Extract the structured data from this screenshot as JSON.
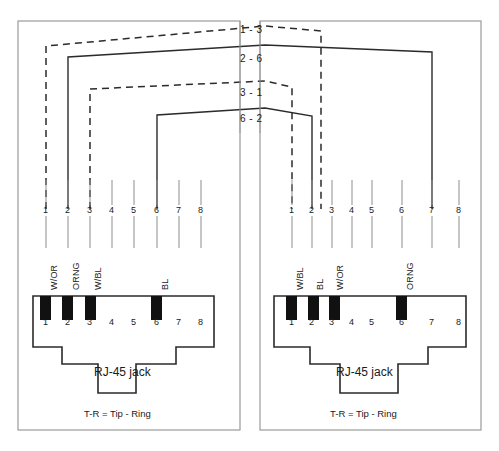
{
  "diagram": {
    "panels": [
      {
        "id": "left",
        "jack_label": "RJ-45 jack",
        "footnote": "T-R = Tip - Ring",
        "pin_numbers": [
          "1",
          "2",
          "3",
          "4",
          "5",
          "6",
          "7",
          "8"
        ],
        "jack_pin_numbers": [
          "1",
          "2",
          "3",
          "4",
          "5",
          "6",
          "7",
          "8"
        ],
        "wire_labels": [
          {
            "pin": 1,
            "text": "W/OR"
          },
          {
            "pin": 2,
            "text": "ORNG"
          },
          {
            "pin": 3,
            "text": "W/BL"
          },
          {
            "pin": 6,
            "text": "BL"
          }
        ],
        "contacts_filled": [
          1,
          2,
          3,
          6
        ]
      },
      {
        "id": "right",
        "jack_label": "RJ-45 jack",
        "footnote": "T-R = Tip - Ring",
        "pin_numbers": [
          "1",
          "2",
          "3",
          "4",
          "5",
          "6",
          "7",
          "8"
        ],
        "jack_pin_numbers": [
          "1",
          "2",
          "3",
          "4",
          "5",
          "6",
          "7",
          "8"
        ],
        "wire_labels": [
          {
            "pin": 1,
            "text": "W/BL"
          },
          {
            "pin": 2,
            "text": "BL"
          },
          {
            "pin": 3,
            "text": "W/OR"
          },
          {
            "pin": 6,
            "text": "ORNG"
          }
        ],
        "contacts_filled": [
          1,
          2,
          3,
          6
        ]
      }
    ],
    "crossover_labels": [
      {
        "text": "1 - 3",
        "style": "dashed"
      },
      {
        "text": "2 - 6",
        "style": "solid"
      },
      {
        "text": "3 - 1",
        "style": "dashed"
      },
      {
        "text": "6 - 2",
        "style": "solid"
      }
    ],
    "colors": {
      "line": "#2b2b2b",
      "panel_border": "#9a9a9a",
      "contact_fill": "#111111",
      "background": "#ffffff"
    }
  }
}
